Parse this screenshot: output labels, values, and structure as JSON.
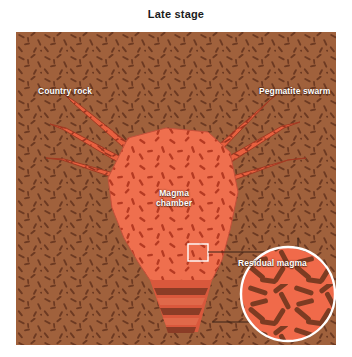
{
  "title": "Late stage",
  "labels": {
    "country_rock": "Country rock",
    "pegmatite_swarm": "Pegmatite swarm",
    "magma_chamber_line1": "Magma",
    "magma_chamber_line2": "chamber",
    "residual_magma": "Residual magma",
    "early_formed_crystals": "Early formed crystals"
  },
  "colors": {
    "country_rock": "#a0613c",
    "country_rock_crystal": "#6d3a22",
    "magma": "#ef6f4e",
    "magma_crystal": "#b63a22",
    "pegmatite": "#e8603f",
    "cumulate_band_dark": "#8b3c26",
    "cumulate_band_light": "#e0694a",
    "inset_border": "#ffffff",
    "leader_line": "#3a2217",
    "title_text": "#1b1b1b",
    "label_text": "#ffffff",
    "background": "#ffffff"
  },
  "diagram": {
    "type": "geologic-cross-section",
    "stage": "Late stage",
    "features": [
      "country rock host with randomly oriented crystal texture",
      "central irregular magma chamber",
      "pegmatite dike swarm radiating from chamber roof, three dikes per side",
      "residual magma region with magnified inset marker box",
      "early formed crystals settled as layered cumulate bands at chamber floor",
      "circular magnified inset showing enlarged elongate crystals in melt"
    ]
  },
  "inset": {
    "shape": "circle",
    "content": "enlarged randomly oriented elongate dark crystals in orange residual melt",
    "source_marker": "small square outline inside magma chamber"
  }
}
